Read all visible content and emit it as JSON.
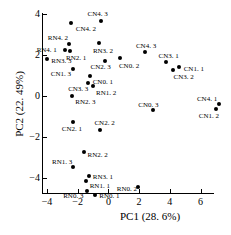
{
  "chart_data": {
    "type": "scatter",
    "title": "",
    "xlabel": "PC1 (28. 6%)",
    "ylabel": "PC2 (22. 49%)",
    "xlim": [
      -4.8,
      7.6
    ],
    "ylim": [
      -5.2,
      4.3
    ],
    "xticks": [
      -4,
      -2,
      0,
      2,
      4,
      6
    ],
    "xticklabels": [
      "−4",
      "−2",
      "0",
      "2",
      "4",
      "6"
    ],
    "yticks": [
      4,
      2,
      0,
      -2,
      -4
    ],
    "yticklabels": [
      "4",
      "2",
      "0",
      "−2",
      "−4"
    ],
    "grid": false,
    "legend": "none",
    "marker": "filled-circle",
    "marker_color": "#000000",
    "points": [
      {
        "label": "CN4. 3",
        "x": -0.45,
        "y": 3.68,
        "lx": -14,
        "ly": -11
      },
      {
        "label": "CN4. 2",
        "x": -2.45,
        "y": 3.55,
        "lx": 5,
        "ly": 2
      },
      {
        "label": "RN4. 2",
        "x": -2.58,
        "y": 2.55,
        "lx": -21,
        "ly": -10
      },
      {
        "label": "RN4. 1",
        "x": -2.85,
        "y": 2.25,
        "lx": -28,
        "ly": -4
      },
      {
        "label": "RN2. 1",
        "x": -2.5,
        "y": 2.18,
        "lx": -4,
        "ly": 3
      },
      {
        "label": "RN3. 3",
        "x": -3.98,
        "y": 1.8,
        "lx": 4,
        "ly": -2
      },
      {
        "label": "RN3. 2",
        "x": -0.62,
        "y": 2.6,
        "lx": -6,
        "ly": 4
      },
      {
        "label": "CN4. 3",
        "x": 2.38,
        "y": 2.15,
        "lx": -9,
        "ly": -10
      },
      {
        "label": "CN3. 1",
        "x": 3.72,
        "y": 1.68,
        "lx": -7,
        "ly": -10
      },
      {
        "label": "CN1. 1",
        "x": 4.58,
        "y": 1.4,
        "lx": 5,
        "ly": -2
      },
      {
        "label": "CN3. 2",
        "x": 4.18,
        "y": 1.25,
        "lx": 1,
        "ly": 3
      },
      {
        "label": "CN1. 3",
        "x": -2.32,
        "y": 1.3,
        "lx": -22,
        "ly": 1
      },
      {
        "label": "CN2. 3",
        "x": -0.25,
        "y": 1.72,
        "lx": -14,
        "ly": 2
      },
      {
        "label": "CN0. 2",
        "x": 0.75,
        "y": 1.85,
        "lx": -1,
        "ly": 4
      },
      {
        "label": "CN0. 1",
        "x": -1.22,
        "y": 0.98,
        "lx": 3,
        "ly": 2
      },
      {
        "label": "CN3. 3",
        "x": -1.32,
        "y": 0.65,
        "lx": -20,
        "ly": 2
      },
      {
        "label": "RN1. 2",
        "x": -1.0,
        "y": 0.48,
        "lx": 3,
        "ly": 3
      },
      {
        "label": "RN2. 3",
        "x": -2.35,
        "y": 0.02,
        "lx": 3,
        "ly": 2
      },
      {
        "label": "CN0. 3",
        "x": 2.92,
        "y": -0.7,
        "lx": -15,
        "ly": -9
      },
      {
        "label": "CN4. 1",
        "x": 7.2,
        "y": -0.38,
        "lx": -22,
        "ly": -9
      },
      {
        "label": "CN1. 2",
        "x": 7.0,
        "y": -0.62,
        "lx": -17,
        "ly": 3
      },
      {
        "label": "CN2. 1",
        "x": -2.32,
        "y": -1.28,
        "lx": -11,
        "ly": 3
      },
      {
        "label": "CN2. 2",
        "x": -0.52,
        "y": -1.68,
        "lx": -6,
        "ly": -11
      },
      {
        "label": "RN2. 2",
        "x": -1.62,
        "y": -2.72,
        "lx": 4,
        "ly": -1
      },
      {
        "label": "RN1. 3",
        "x": -2.3,
        "y": -3.48,
        "lx": -21,
        "ly": -9
      },
      {
        "label": "RN3. 1",
        "x": -1.28,
        "y": -3.9,
        "lx": 4,
        "ly": -3
      },
      {
        "label": "RN1. 1",
        "x": -1.48,
        "y": -4.15,
        "lx": 4,
        "ly": 1
      },
      {
        "label": "RN0. 3",
        "x": -1.38,
        "y": -4.62,
        "lx": -24,
        "ly": 1
      },
      {
        "label": "RN0. 1",
        "x": -0.85,
        "y": -4.85,
        "lx": 4,
        "ly": -3
      },
      {
        "label": "RN0. 2",
        "x": 1.92,
        "y": -4.45,
        "lx": -21,
        "ly": -2
      }
    ]
  },
  "axes": {
    "x_title": "PC1 (28. 6%)",
    "y_title": "PC2 (22. 49%)"
  }
}
